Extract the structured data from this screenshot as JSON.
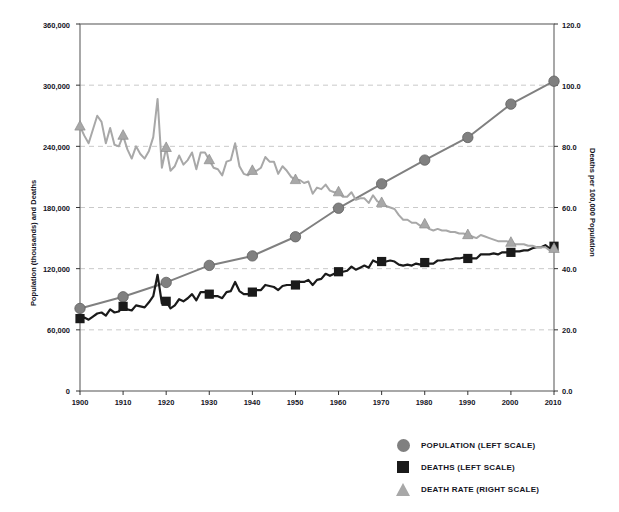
{
  "title": "",
  "axes": {
    "left_label": "Population (thousands) and Deaths",
    "right_label": "Deaths per 100,000 Population",
    "x_label": "",
    "y_ticks": [
      "0",
      "60,000",
      "120,000",
      "180,000",
      "240,000",
      "300,000",
      "360,000"
    ],
    "y2_ticks": [
      "0.0",
      "20.0",
      "40.0",
      "60.0",
      "80.0",
      "100.0",
      "120.0"
    ],
    "x_ticks": [
      "1900",
      "1910",
      "1920",
      "1930",
      "1940",
      "1950",
      "1960",
      "1970",
      "1980",
      "1990",
      "2000",
      "2010"
    ]
  },
  "legend": {
    "items": [
      {
        "label": "POPULATION (LEFT SCALE)",
        "marker": "circle",
        "color": "#808080"
      },
      {
        "label": "DEATHS (LEFT SCALE)",
        "marker": "square",
        "color": "#1a1a1a"
      },
      {
        "label": "DEATH RATE (RIGHT SCALE)",
        "marker": "triangle",
        "color": "#a8a8a8"
      }
    ]
  },
  "colors": {
    "population": "#808080",
    "deaths": "#1a1a1a",
    "death_rate": "#a8a8a8",
    "grid": "#c9c9c9",
    "axis": "#6e6e6e",
    "background": "#ffffff"
  },
  "chart_data": {
    "type": "line",
    "title": "",
    "xlabel": "",
    "ylabel": "Population (thousands) and Deaths",
    "y2label": "Deaths per 100,000 Population",
    "xlim": [
      1900,
      2010
    ],
    "ylim": [
      0,
      360000
    ],
    "y2lim": [
      0,
      120
    ],
    "grid": true,
    "legend_position": "bottom-right",
    "series": [
      {
        "name": "POPULATION (LEFT SCALE)",
        "axis": "left",
        "color": "#808080",
        "marker": "circle",
        "marker_years": [
          1900,
          1910,
          1920,
          1930,
          1940,
          1950,
          1960,
          1970,
          1980,
          1990,
          2000,
          2010
        ],
        "x": [
          1900,
          1910,
          1920,
          1930,
          1940,
          1950,
          1960,
          1970,
          1980,
          1990,
          2000,
          2010
        ],
        "values": [
          81000,
          92400,
          106500,
          123200,
          132500,
          151300,
          179300,
          203200,
          226500,
          248700,
          281400,
          303900
        ]
      },
      {
        "name": "DEATHS (LEFT SCALE)",
        "axis": "left",
        "color": "#1a1a1a",
        "marker": "square",
        "marker_years": [
          1900,
          1910,
          1920,
          1930,
          1940,
          1950,
          1960,
          1970,
          1980,
          1990,
          2000,
          2010
        ],
        "x": [
          1900,
          1901,
          1902,
          1903,
          1904,
          1905,
          1906,
          1907,
          1908,
          1909,
          1910,
          1911,
          1912,
          1913,
          1914,
          1915,
          1916,
          1917,
          1918,
          1919,
          1920,
          1921,
          1922,
          1923,
          1924,
          1925,
          1926,
          1927,
          1928,
          1929,
          1930,
          1931,
          1932,
          1933,
          1934,
          1935,
          1936,
          1937,
          1938,
          1939,
          1940,
          1941,
          1942,
          1943,
          1944,
          1945,
          1946,
          1947,
          1948,
          1949,
          1950,
          1951,
          1952,
          1953,
          1954,
          1955,
          1956,
          1957,
          1958,
          1959,
          1960,
          1961,
          1962,
          1963,
          1964,
          1965,
          1966,
          1967,
          1968,
          1969,
          1970,
          1971,
          1972,
          1973,
          1974,
          1975,
          1976,
          1977,
          1978,
          1979,
          1980,
          1981,
          1982,
          1983,
          1984,
          1985,
          1986,
          1987,
          1988,
          1989,
          1990,
          1991,
          1992,
          1993,
          1994,
          1995,
          1996,
          1997,
          1998,
          1999,
          2000,
          2001,
          2002,
          2003,
          2004,
          2005,
          2006,
          2007,
          2008,
          2009,
          2010
        ],
        "values": [
          71000,
          72000,
          70000,
          73000,
          76000,
          77000,
          74000,
          80000,
          77000,
          78000,
          83000,
          80000,
          79000,
          84000,
          83000,
          82000,
          87000,
          93000,
          114000,
          86000,
          88000,
          81000,
          84000,
          90000,
          88000,
          91000,
          95000,
          89000,
          97000,
          97000,
          95000,
          93000,
          93000,
          91000,
          97000,
          98000,
          107000,
          98000,
          95000,
          95000,
          97000,
          99000,
          99000,
          104000,
          103000,
          102000,
          99000,
          103000,
          104000,
          104000,
          104000,
          107000,
          107000,
          109000,
          104000,
          109000,
          110000,
          115000,
          113000,
          115000,
          117000,
          117000,
          118000,
          122000,
          119000,
          121000,
          123000,
          121000,
          128000,
          126000,
          127000,
          127000,
          128000,
          127000,
          124000,
          123000,
          124000,
          123000,
          125000,
          124000,
          126000,
          125000,
          125000,
          128000,
          128000,
          129000,
          129000,
          130000,
          130000,
          131000,
          130000,
          130000,
          130000,
          134000,
          134000,
          134000,
          135000,
          134000,
          136000,
          136000,
          136000,
          137000,
          137000,
          138000,
          138000,
          140000,
          141000,
          141000,
          143000,
          140000,
          142000
        ]
      },
      {
        "name": "DEATH RATE (RIGHT SCALE)",
        "axis": "right",
        "color": "#a8a8a8",
        "marker": "triangle",
        "marker_years": [
          1900,
          1910,
          1920,
          1930,
          1940,
          1950,
          1960,
          1970,
          1980,
          1990,
          2000,
          2010
        ],
        "x": [
          1900,
          1901,
          1902,
          1903,
          1904,
          1905,
          1906,
          1907,
          1908,
          1909,
          1910,
          1911,
          1912,
          1913,
          1914,
          1915,
          1916,
          1917,
          1918,
          1919,
          1920,
          1921,
          1922,
          1923,
          1924,
          1925,
          1926,
          1927,
          1928,
          1929,
          1930,
          1931,
          1932,
          1933,
          1934,
          1935,
          1936,
          1937,
          1938,
          1939,
          1940,
          1941,
          1942,
          1943,
          1944,
          1945,
          1946,
          1947,
          1948,
          1949,
          1950,
          1951,
          1952,
          1953,
          1954,
          1955,
          1956,
          1957,
          1958,
          1959,
          1960,
          1961,
          1962,
          1963,
          1964,
          1965,
          1966,
          1967,
          1968,
          1969,
          1970,
          1971,
          1972,
          1973,
          1974,
          1975,
          1976,
          1977,
          1978,
          1979,
          1980,
          1981,
          1982,
          1983,
          1984,
          1985,
          1986,
          1987,
          1988,
          1989,
          1990,
          1991,
          1992,
          1993,
          1994,
          1995,
          1996,
          1997,
          1998,
          1999,
          2000,
          2001,
          2002,
          2003,
          2004,
          2005,
          2006,
          2007,
          2008,
          2009,
          2010
        ],
        "values": [
          86.5,
          83.5,
          81.0,
          85.5,
          90.0,
          88.0,
          81.0,
          86.0,
          80.5,
          80.0,
          83.5,
          79.0,
          76.0,
          80.0,
          77.5,
          76.0,
          78.5,
          83.0,
          95.5,
          73.0,
          79.5,
          72.0,
          73.5,
          77.0,
          74.0,
          75.5,
          78.0,
          72.5,
          78.0,
          78.0,
          75.5,
          73.0,
          72.5,
          70.5,
          75.0,
          75.5,
          81.0,
          73.5,
          71.0,
          70.5,
          72.0,
          72.0,
          73.0,
          76.5,
          75.0,
          75.0,
          71.0,
          73.5,
          72.0,
          70.0,
          69.0,
          69.0,
          68.0,
          68.5,
          64.5,
          66.5,
          66.0,
          67.5,
          65.5,
          65.0,
          65.0,
          63.5,
          63.5,
          65.0,
          62.5,
          63.0,
          63.0,
          61.5,
          64.0,
          62.0,
          61.5,
          60.5,
          60.0,
          59.5,
          57.5,
          56.0,
          56.0,
          55.0,
          55.0,
          54.0,
          54.5,
          53.0,
          52.5,
          53.0,
          52.5,
          52.5,
          52.0,
          52.0,
          51.5,
          51.5,
          51.0,
          50.5,
          50.0,
          51.0,
          50.5,
          50.0,
          49.5,
          49.0,
          49.0,
          49.0,
          48.5,
          48.0,
          48.0,
          48.0,
          47.5,
          47.5,
          47.0,
          47.0,
          47.0,
          46.0,
          46.5
        ]
      }
    ]
  }
}
